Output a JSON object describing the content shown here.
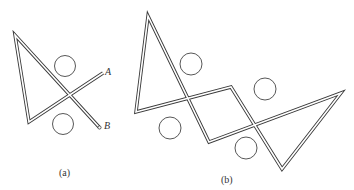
{
  "figure": {
    "panels": [
      {
        "id": "a",
        "caption": "(a)",
        "endpoint_labels": [
          "A",
          "B"
        ],
        "description": "Single-crossing loop formed by a double-line wire with two circles on either side of the crossing",
        "circles": 2,
        "crossings": 1
      },
      {
        "id": "b",
        "caption": "(b)",
        "description": "Closed double-line loop with two crossings forming two triangles joined by a central square, four circles placed in the regions",
        "circles": 4,
        "crossings": 2
      }
    ],
    "colors": {
      "stroke": "#333333",
      "background": "#ffffff"
    }
  }
}
